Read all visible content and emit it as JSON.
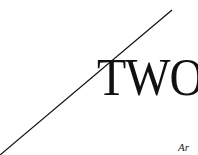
{
  "artwork": {
    "headline": "TWO",
    "caption_fragment": "Ar",
    "line": {
      "x1": 0,
      "y1": 155,
      "x2": 172,
      "y2": 10,
      "color": "#111111"
    },
    "text_color": "#111111",
    "background": "#ffffff"
  }
}
